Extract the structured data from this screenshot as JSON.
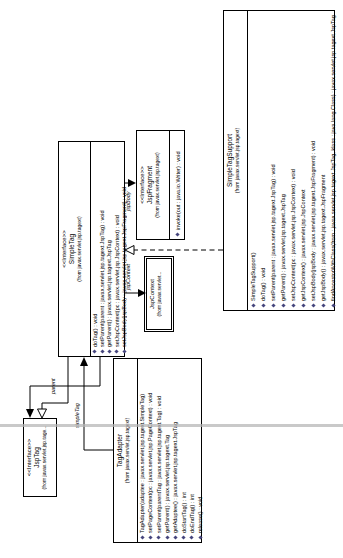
{
  "diagram": {
    "classes": {
      "jspTag": {
        "stereotype": "<<Interface>>",
        "name": "JspTag",
        "package": "(from javax.servlet.jsp.tage...",
        "methods": []
      },
      "simpleTag": {
        "stereotype": "<<Interface>>",
        "name": "SimpleTag",
        "package": "(from javax.servlet.jsp.tagext)",
        "methods": [
          "doTag() : void",
          "setParent(parent : javax.servlet.jsp.tagext.JspTag) : void",
          "getParent() : javax.servlet.jsp.tagext.JspTag",
          "setJspContext(pc : javax.servlet.jsp.JspContext) : void",
          "setJspBody(jspBody : javax.servlet.jsp.tagext.JspFragment) : void"
        ]
      },
      "tagAdapter": {
        "stereotype": "",
        "name": "TagAdapter",
        "package": "(from javax.servlet.jsp.tagext)",
        "methods": [
          "TagAdapter(adaptee : javax.servlet.jsp.tagext.SimpleTag)",
          "setPageContext(pc : javax.servlet.jsp.PageContext) : void",
          "setParent(parentTag : javax.servlet.jsp.tagext.Tag) : void",
          "getParent() : javax.servlet.jsp.tagext.Tag",
          "getAdaptee() : javax.servlet.jsp.tagext.JspTag",
          "doStartTag() : int",
          "doEndTag() : int",
          "release() : void"
        ]
      },
      "jspFragment": {
        "stereotype": "<<Interface>>",
        "name": "JspFragment",
        "package": "(from javax.servlet.jsp.tagext)",
        "methods": [
          "invoke(out : java.io.Writer) : void"
        ]
      },
      "jspContext": {
        "stereotype": "",
        "name": "JspContext",
        "package": "(from javax.servlet...",
        "methods": []
      },
      "simpleTagSupport": {
        "stereotype": "",
        "name": "SimpleTagSupport",
        "package": "(from javax.servlet.jsp.tagext)",
        "methods": [
          "SimpleTagSupport()",
          "doTag() : void",
          "setParent(parent : javax.servlet.jsp.tagext.JspTag) : void",
          "getParent() : javax.servlet.jsp.tagext.JspTag",
          "setJspContext(pc : javax.servlet.jsp.JspContext) : void",
          "getJspContext() : javax.servlet.jsp.JspContext",
          "setJspBody(jspBody : javax.servlet.jsp.tagext.JspFragment) : void",
          "getJspBody() : javax.servlet.jsp.tagext.JspFragment",
          "findAncestorWithClass(from : javax.servlet.jsp.tagext.JspTag, klass : java.lang.Class) : javax.servlet.jsp.tagext.JspTag"
        ]
      }
    },
    "labels": {
      "parent": "parent",
      "simpleTag": "simpleTag",
      "jspBody": "jspBody",
      "jspContext": "jspContext"
    },
    "colors": {
      "border": "#000000",
      "fill": "#ffffff",
      "page_line": "#b4b4b4",
      "method_icon": "#45457d"
    }
  }
}
